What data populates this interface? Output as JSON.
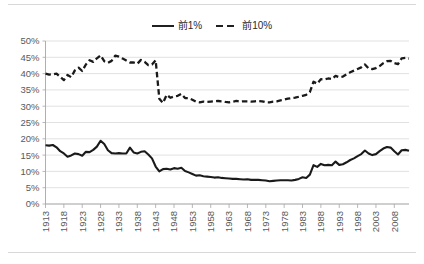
{
  "chart_data": {
    "type": "line",
    "title": "",
    "subtitle": "",
    "xlabel": "",
    "ylabel": "",
    "xlim": [
      1913,
      2012
    ],
    "ylim": [
      0,
      50
    ],
    "grid": true,
    "legend_position": "top-center",
    "y_tick_labels": [
      "0%",
      "5%",
      "10%",
      "15%",
      "20%",
      "25%",
      "30%",
      "35%",
      "40%",
      "45%",
      "50%"
    ],
    "y_ticks": [
      0,
      5,
      10,
      15,
      20,
      25,
      30,
      35,
      40,
      45,
      50
    ],
    "x_tick_labels": [
      "1913",
      "1918",
      "1923",
      "1928",
      "1933",
      "1938",
      "1943",
      "1948",
      "1953",
      "1958",
      "1963",
      "1968",
      "1973",
      "1978",
      "1983",
      "1988",
      "1993",
      "1998",
      "2003",
      "2008"
    ],
    "x_ticks": [
      1913,
      1918,
      1923,
      1928,
      1933,
      1938,
      1943,
      1948,
      1953,
      1958,
      1963,
      1968,
      1973,
      1978,
      1983,
      1988,
      1993,
      1998,
      2003,
      2008
    ],
    "x": [
      1913,
      1914,
      1915,
      1916,
      1917,
      1918,
      1919,
      1920,
      1921,
      1922,
      1923,
      1924,
      1925,
      1926,
      1927,
      1928,
      1929,
      1930,
      1931,
      1932,
      1933,
      1934,
      1935,
      1936,
      1937,
      1938,
      1939,
      1940,
      1941,
      1942,
      1943,
      1944,
      1945,
      1946,
      1947,
      1948,
      1949,
      1950,
      1951,
      1952,
      1953,
      1954,
      1955,
      1956,
      1957,
      1958,
      1959,
      1960,
      1961,
      1962,
      1963,
      1964,
      1965,
      1966,
      1967,
      1968,
      1969,
      1970,
      1971,
      1972,
      1973,
      1974,
      1975,
      1976,
      1977,
      1978,
      1979,
      1980,
      1981,
      1982,
      1983,
      1984,
      1985,
      1986,
      1987,
      1988,
      1989,
      1990,
      1991,
      1992,
      1993,
      1994,
      1995,
      1996,
      1997,
      1998,
      1999,
      2000,
      2001,
      2002,
      2003,
      2004,
      2005,
      2006,
      2007,
      2008,
      2009,
      2010,
      2011,
      2012
    ],
    "series": [
      {
        "name": "前1%",
        "style": "solid",
        "color": "#1a1a1a",
        "values": [
          18.0,
          17.9,
          18.1,
          17.4,
          16.2,
          15.5,
          14.5,
          14.9,
          15.5,
          15.3,
          14.8,
          16.0,
          15.9,
          16.6,
          17.6,
          19.4,
          18.4,
          16.5,
          15.6,
          15.5,
          15.6,
          15.5,
          15.5,
          17.3,
          15.8,
          15.5,
          16.0,
          16.2,
          15.2,
          14.0,
          11.5,
          10.0,
          10.7,
          10.8,
          10.6,
          11.0,
          10.8,
          11.1,
          10.1,
          9.7,
          9.2,
          8.7,
          8.8,
          8.5,
          8.4,
          8.3,
          8.1,
          8.2,
          8.0,
          7.9,
          7.8,
          7.7,
          7.7,
          7.6,
          7.5,
          7.6,
          7.4,
          7.4,
          7.4,
          7.3,
          7.2,
          7.0,
          7.1,
          7.2,
          7.3,
          7.3,
          7.3,
          7.2,
          7.4,
          7.7,
          8.2,
          8.0,
          9.0,
          11.9,
          11.4,
          12.3,
          11.9,
          12.0,
          11.9,
          13.0,
          12.0,
          12.2,
          12.8,
          13.5,
          14.0,
          14.7,
          15.3,
          16.4,
          15.5,
          15.0,
          15.3,
          16.2,
          17.0,
          17.5,
          17.3,
          16.2,
          15.2,
          16.5,
          16.6,
          16.3
        ]
      },
      {
        "name": "前10%",
        "style": "dashed",
        "color": "#1a1a1a",
        "values": [
          40.0,
          39.7,
          39.8,
          40.0,
          39.0,
          38.0,
          39.6,
          38.9,
          41.0,
          41.8,
          40.8,
          42.8,
          44.1,
          43.6,
          44.7,
          45.6,
          43.8,
          43.3,
          43.9,
          45.5,
          45.2,
          44.6,
          44.0,
          43.4,
          43.4,
          43.0,
          44.2,
          43.6,
          42.6,
          42.8,
          44.1,
          32.3,
          31.0,
          33.5,
          32.6,
          33.0,
          33.2,
          33.8,
          32.5,
          32.5,
          32.0,
          31.4,
          31.2,
          31.4,
          31.3,
          31.4,
          31.5,
          31.6,
          31.5,
          31.3,
          31.2,
          31.4,
          31.6,
          31.4,
          31.5,
          31.5,
          31.4,
          31.5,
          31.6,
          31.5,
          31.2,
          31.2,
          31.4,
          31.5,
          31.8,
          32.0,
          32.3,
          32.5,
          32.6,
          32.9,
          33.2,
          33.5,
          34.3,
          37.5,
          36.9,
          38.3,
          38.2,
          38.5,
          38.3,
          39.3,
          38.9,
          39.1,
          39.8,
          40.4,
          40.9,
          41.4,
          41.9,
          42.8,
          41.6,
          41.4,
          41.7,
          42.3,
          43.2,
          43.8,
          43.9,
          43.2,
          42.9,
          44.7,
          44.8,
          44.6
        ]
      }
    ]
  },
  "legend": {
    "entries": [
      {
        "label": "前1%",
        "style": "solid",
        "icon": "solid-line-swatch"
      },
      {
        "label": "前10%",
        "style": "dashed",
        "icon": "dashed-line-swatch"
      }
    ]
  },
  "colors": {
    "series": "#1a1a1a",
    "gridline": "#d9d9d9",
    "axis": "#a6a6a6",
    "tick_text": "#595959",
    "background": "#ffffff",
    "rule": "#d8d8d8"
  }
}
